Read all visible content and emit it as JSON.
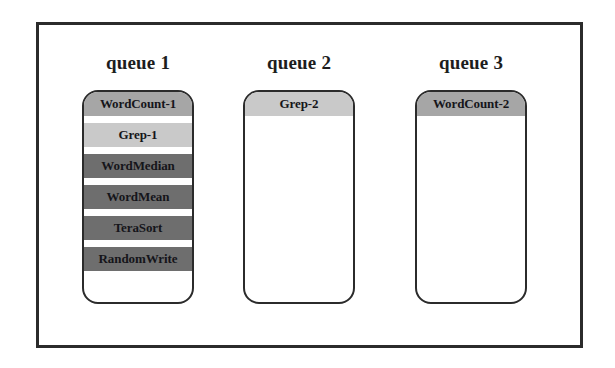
{
  "diagram": {
    "type": "queue-allocation-diagram",
    "frame": {
      "border_color": "#2b2b2b",
      "background_color": "#ffffff"
    },
    "shades": {
      "light": "#c9c9c9",
      "medium": "#a6a6a6",
      "dark": "#6e6e6e"
    },
    "queues": [
      {
        "title": "queue 1",
        "tasks": [
          {
            "label": "WordCount-1",
            "shade": "#a6a6a6"
          },
          {
            "label": "Grep-1",
            "shade": "#c9c9c9"
          },
          {
            "label": "WordMedian",
            "shade": "#6e6e6e"
          },
          {
            "label": "WordMean",
            "shade": "#6e6e6e"
          },
          {
            "label": "TeraSort",
            "shade": "#6e6e6e"
          },
          {
            "label": "RandomWrite",
            "shade": "#6e6e6e"
          }
        ]
      },
      {
        "title": "queue 2",
        "tasks": [
          {
            "label": "Grep-2",
            "shade": "#c9c9c9"
          }
        ]
      },
      {
        "title": "queue 3",
        "tasks": [
          {
            "label": "WordCount-2",
            "shade": "#a6a6a6"
          }
        ]
      }
    ]
  }
}
